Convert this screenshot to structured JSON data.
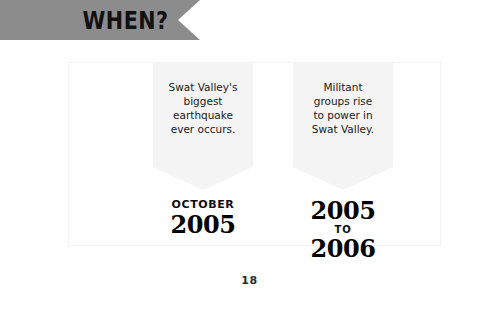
{
  "page": {
    "background_color": "#ffffff",
    "page_number": "18"
  },
  "header": {
    "ribbon_label": "WHEN?",
    "ribbon_color": "#8c8c8c",
    "text_color": "#111111"
  },
  "timeline": {
    "entries": [
      {
        "body_line_1": "Swat Valley's",
        "body_line_2": "biggest",
        "body_line_3": "earthquake",
        "body_line_4": "ever occurs.",
        "date_kicker": "OCTOBER",
        "date_year": "2005",
        "date_connector": "",
        "date_year_end": ""
      },
      {
        "body_line_1": "Militant",
        "body_line_2": "groups rise",
        "body_line_3": "to power in",
        "body_line_4": "Swat Valley.",
        "date_kicker": "",
        "date_year": "2005",
        "date_connector": "TO",
        "date_year_end": "2006"
      }
    ],
    "pennant_color": "#f4f4f4",
    "frame_color": "#f2f2f2"
  }
}
